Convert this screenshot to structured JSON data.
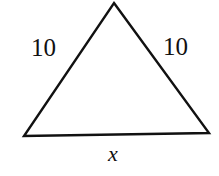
{
  "figure": {
    "type": "isosceles-triangle-diagram",
    "background_color": "#ffffff",
    "stroke_color": "#111111",
    "stroke_width": 2.4,
    "vertices": {
      "apex": [
        114,
        3
      ],
      "bottom_left": [
        24,
        136
      ],
      "bottom_right": [
        209,
        133
      ]
    },
    "labels": {
      "left_side": "10",
      "right_side": "10",
      "base_side": "x"
    }
  }
}
